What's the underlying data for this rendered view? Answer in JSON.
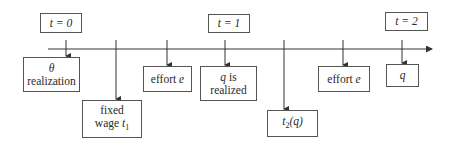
{
  "diagram": {
    "type": "timeline",
    "time_labels": [
      {
        "id": "t0",
        "text": "t = 0"
      },
      {
        "id": "t1",
        "text": "t = 1"
      },
      {
        "id": "t2",
        "text": "t = 2"
      }
    ],
    "events": [
      {
        "id": "theta",
        "line1": "θ",
        "line2": "realization"
      },
      {
        "id": "fixed-wage",
        "line1": "fixed",
        "line2_prefix": "wage ",
        "line2_var": "t",
        "line2_sub": "1"
      },
      {
        "id": "effort-1",
        "prefix": "effort ",
        "var": "e"
      },
      {
        "id": "q-realized",
        "line1_var": "q",
        "line1_suffix": " is",
        "line2": "realized"
      },
      {
        "id": "t2q",
        "var": "t",
        "sub": "2",
        "suffix": "(q)"
      },
      {
        "id": "effort-2",
        "prefix": "effort ",
        "var": "e"
      },
      {
        "id": "q-final",
        "var": "q"
      }
    ],
    "colors": {
      "line": "#333333",
      "border": "#555555",
      "text": "#2a2a2a"
    }
  }
}
